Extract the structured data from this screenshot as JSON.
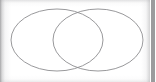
{
  "panel": {
    "width": 156,
    "height": 82,
    "background_color": "#ffffff",
    "title": "",
    "has_text_labels": false
  },
  "edges": {
    "left_shadow_color": "#96969 8",
    "top_shadow_color": "#c4c4c6",
    "bottom_shadow_color": "#cccccd",
    "right_shadow_color": "#b0b0b2"
  },
  "scrollbar": {
    "name": "vertical-scrollbar",
    "track_color": "#fdfdfd",
    "thumb_color": "#9b9b9d",
    "thumb_top": 0,
    "thumb_height": 82,
    "position": "right"
  },
  "chart_data": {
    "type": "diagram",
    "diagram_type": "venn",
    "title": "",
    "subtitle": "",
    "xlabel": "",
    "ylabel": "",
    "legend": [],
    "annotations": [],
    "set_count": 2,
    "stroke_color": "#8d8d90",
    "stroke_width": 0.9,
    "fill": "none",
    "sets": [
      {
        "name": "left-set",
        "label": "",
        "cx": 57,
        "cy": 40,
        "rx": 46,
        "ry": 31,
        "fill": "none",
        "stroke": "#8d8d90"
      },
      {
        "name": "right-set",
        "label": "",
        "cx": 98,
        "cy": 40,
        "rx": 45,
        "ry": 31,
        "fill": "none",
        "stroke": "#8d8d90"
      }
    ],
    "intersection_points": [
      {
        "x": 78,
        "y": 11
      },
      {
        "x": 78,
        "y": 68
      }
    ],
    "regions": [
      {
        "name": "left-only",
        "label": "",
        "value": null
      },
      {
        "name": "intersection",
        "label": "",
        "value": null
      },
      {
        "name": "right-only",
        "label": "",
        "value": null
      }
    ]
  }
}
